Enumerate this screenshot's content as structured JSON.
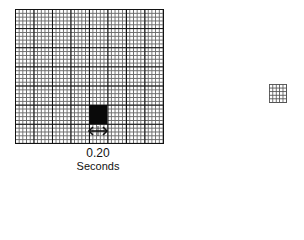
{
  "figure": {
    "main_grid": {
      "major_columns": 8,
      "major_rows": 7,
      "minor_per_major": 5,
      "highlighted_cell": {
        "column": 4,
        "row": 5,
        "color": "#0a0a0a"
      }
    },
    "interval_marker": {
      "value_label": "0.20",
      "unit_label": "Seconds"
    },
    "small_grid": {
      "columns": 5,
      "rows": 5
    }
  }
}
